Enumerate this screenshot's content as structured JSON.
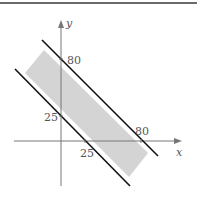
{
  "figure": {
    "axes": {
      "x_label": "x",
      "y_label": "y"
    },
    "ticks": {
      "y_upper": "80",
      "y_lower": "25",
      "x_lower": "25",
      "x_upper": "80"
    },
    "lines": [
      {
        "name": "x+y=80",
        "intercept": 80
      },
      {
        "name": "x+y=25",
        "intercept": 25
      }
    ],
    "colors": {
      "shade": "#d4d4d4",
      "line": "#111111",
      "axis": "#777777",
      "rule": "#6b6b6b"
    }
  }
}
